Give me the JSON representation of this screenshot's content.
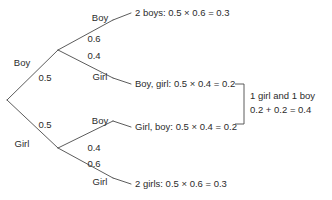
{
  "diagram": {
    "type": "probability-tree",
    "root": {
      "label": ""
    },
    "level1": [
      {
        "name": "boy-first",
        "outcome": "Boy",
        "probability": "0.5"
      },
      {
        "name": "girl-first",
        "outcome": "Girl",
        "probability": "0.5"
      }
    ],
    "level2": [
      {
        "name": "boy-boy",
        "parent": "boy-first",
        "outcome": "Boy",
        "probability": "0.6",
        "result": "2 boys: 0.5 × 0.6 = 0.3"
      },
      {
        "name": "boy-girl",
        "parent": "boy-first",
        "outcome": "Girl",
        "probability": "0.4",
        "result": "Boy, girl: 0.5 × 0.4 = 0.2"
      },
      {
        "name": "girl-boy",
        "parent": "girl-first",
        "outcome": "Boy",
        "probability": "0.4",
        "result": "Girl, boy: 0.5 × 0.4 = 0.2"
      },
      {
        "name": "girl-girl",
        "parent": "girl-first",
        "outcome": "Girl",
        "probability": "0.6",
        "result": "2 girls: 0.5 × 0.6 = 0.3"
      }
    ],
    "summary": {
      "line1": "1 girl and 1 boy",
      "line2": "0.2 + 0.2 = 0.4"
    },
    "colors": {
      "line": "#4a4a4a",
      "text": "#2b2b2b",
      "background": "#ffffff"
    }
  }
}
